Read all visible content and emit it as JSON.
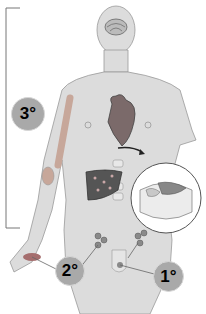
{
  "diagram": {
    "labels": {
      "primary": "1°",
      "secondary": "2°",
      "tertiary": "3°"
    },
    "colors": {
      "body": "#d9d9d9",
      "badge": "#a9a9a9",
      "organ_dark": "#555555",
      "line": "#666666"
    }
  }
}
